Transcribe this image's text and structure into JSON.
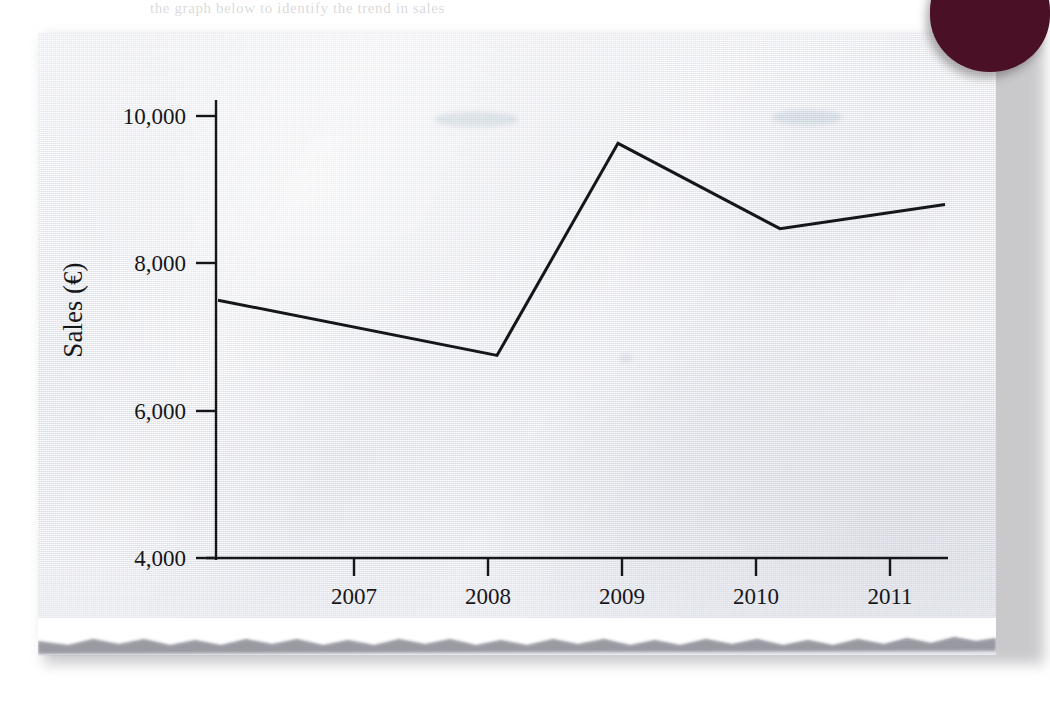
{
  "page": {
    "bleed_text": "the graph below to identify the trend in sales",
    "corner_tab_color": "#4a1026",
    "paper_color": "#eceef5",
    "ink_color": "#15161a"
  },
  "chart_data": {
    "type": "line",
    "title": "",
    "xlabel": "",
    "ylabel": "Sales (€)",
    "ylabel_currency_symbol": "€",
    "grid": false,
    "legend": "none",
    "x": [
      "2007",
      "2008",
      "2009",
      "2010",
      "2011"
    ],
    "categories": [
      "2007",
      "2008",
      "2009",
      "2010",
      "2011"
    ],
    "xtick_labels": [
      "2007",
      "2008",
      "2009",
      "2010",
      "2011"
    ],
    "ytick_labels": [
      "10,000",
      "8,000",
      "6,000",
      "4,000"
    ],
    "ytick_values": [
      10000,
      8000,
      6000,
      4000
    ],
    "ylim": [
      4000,
      10400
    ],
    "xlim_note": "line extends slightly beyond the first and last year ticks",
    "series": [
      {
        "name": "Sales",
        "color": "#15161a",
        "line_width": 3,
        "markers": "none",
        "points": [
          {
            "x": "pre-2007",
            "value": 7500
          },
          {
            "x": "2008",
            "value": 6750
          },
          {
            "x": "2009",
            "value": 9630
          },
          {
            "x": "2010",
            "value": 8470
          },
          {
            "x": "post-2011",
            "value": 8800
          }
        ],
        "values": [
          7500,
          6750,
          9630,
          8470,
          8800
        ]
      }
    ],
    "axis_style": {
      "y_axis": "visible, solid, ticks outside",
      "x_axis": "visible, solid, ticks below",
      "top_spine": false,
      "right_spine": false
    }
  }
}
